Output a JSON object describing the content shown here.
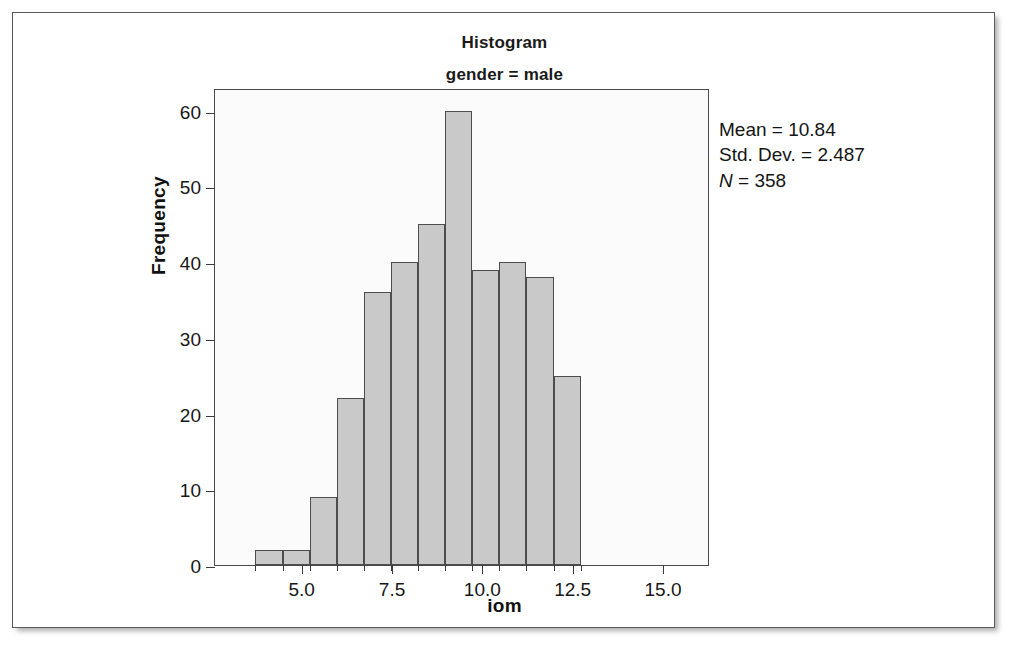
{
  "chart_data": {
    "type": "bar",
    "title": "Histogram",
    "subtitle": "gender = male",
    "xlabel": "iom",
    "ylabel": "Frequency",
    "categories": [
      "3.75",
      "4.50",
      "5.25",
      "6.00",
      "6.75",
      "7.50",
      "8.25",
      "9.00",
      "9.75",
      "10.50",
      "11.25",
      "12.00"
    ],
    "bin_centers": [
      4.1,
      4.85,
      5.6,
      6.35,
      7.1,
      7.85,
      8.6,
      9.35,
      10.1,
      10.85,
      11.6,
      12.35
    ],
    "bin_edges": [
      3.72,
      4.47,
      5.22,
      5.97,
      6.72,
      7.47,
      8.22,
      8.97,
      9.72,
      10.47,
      11.22,
      11.97,
      12.72
    ],
    "values": [
      2,
      2,
      9,
      22,
      36,
      40,
      45,
      60,
      39,
      40,
      38,
      25
    ],
    "x_tick_labels": [
      "5.0",
      "7.5",
      "10.0",
      "12.5",
      "15.0"
    ],
    "x_tick_values": [
      5.0,
      7.5,
      10.0,
      12.5,
      15.0
    ],
    "y_tick_labels": [
      "0",
      "10",
      "20",
      "30",
      "40",
      "50",
      "60"
    ],
    "y_tick_values": [
      0,
      10,
      20,
      30,
      40,
      50,
      60
    ],
    "xlim": [
      2.6,
      16.3
    ],
    "ylim": [
      0,
      63
    ],
    "grid": false,
    "legend": "none",
    "bar_fill_color": "#c9c9c9",
    "bar_edge_color": "#4d4d4d",
    "plot_background_color": "#fbfbfb"
  },
  "statistics": {
    "mean_label": "Mean = 10.84",
    "std_dev_label": "Std. Dev. = 2.487",
    "n_symbol": "N",
    "n_value_label": " = 358",
    "mean": 10.84,
    "std_dev": 2.487,
    "n": 358
  }
}
